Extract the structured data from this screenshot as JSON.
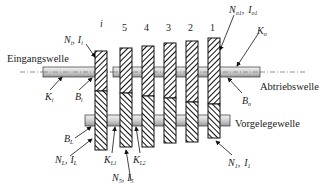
{
  "diagram": {
    "shafts": {
      "input": "Eingangswelle",
      "output": "Abtriebswelle",
      "counter": "Vorgelegewelle"
    },
    "gear_numbers": [
      "i",
      "5",
      "4",
      "3",
      "2",
      "1"
    ],
    "labels": {
      "Ni_Ii": {
        "N": "N",
        "N_sub": "i",
        "sep": ",",
        "I": "I",
        "I_sub": "i"
      },
      "No_Io": {
        "N": "N",
        "N_sub": "o1",
        "sep": ",",
        "I": "I",
        "I_sub": "o1"
      },
      "Ko": {
        "K": "K",
        "sub": "o"
      },
      "Ki": {
        "K": "K",
        "sub": "i"
      },
      "Bi": {
        "B": "B",
        "sub": "i"
      },
      "Bo": {
        "B": "B",
        "sub": "o"
      },
      "BL": {
        "B": "B",
        "sub": "L"
      },
      "NL_IL": {
        "N": "N",
        "N_sub": "L",
        "sep": ",",
        "I": "I",
        "I_sub": "L"
      },
      "KL1": {
        "K": "K",
        "sub": "L1"
      },
      "KL2": {
        "K": "K",
        "sub": "L2"
      },
      "N5_I5": {
        "N": "N",
        "N_sub": "5",
        "sep": ",",
        "I": "I",
        "I_sub": "5"
      },
      "N1_I1": {
        "N": "N",
        "N_sub": "1",
        "sep": ",",
        "I": "I",
        "I_sub": "1"
      }
    },
    "colors": {
      "line": "#111111",
      "shaft_fill": "#d9d9d9",
      "hatch": "#111111",
      "background": "#ffffff"
    }
  }
}
